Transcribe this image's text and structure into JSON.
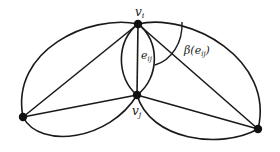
{
  "diagram": {
    "type": "graph",
    "labels": {
      "vi_base": "v",
      "vi_sub": "i",
      "vj_base": "v",
      "vj_sub": "j",
      "eij_base": "e",
      "eij_sub": "ij",
      "beta_prefix": "β(e",
      "beta_sub": "ij",
      "beta_suffix": ")"
    },
    "vertices": [
      {
        "id": "v_i",
        "label": "v_i",
        "x": 138,
        "y": 24
      },
      {
        "id": "v_j",
        "label": "v_j",
        "x": 137,
        "y": 95
      },
      {
        "id": "left",
        "label": "",
        "x": 23,
        "y": 117
      },
      {
        "id": "right",
        "label": "",
        "x": 258,
        "y": 129
      }
    ],
    "edges": [
      {
        "from": "v_i",
        "to": "v_j",
        "kind": "straight",
        "label": "e_ij"
      },
      {
        "from": "v_i",
        "to": "v_j",
        "kind": "curved-left"
      },
      {
        "from": "v_i",
        "to": "v_j",
        "kind": "curved-right"
      },
      {
        "from": "v_i",
        "to": "left",
        "kind": "straight"
      },
      {
        "from": "v_i",
        "to": "left",
        "kind": "curved-outer"
      },
      {
        "from": "v_i",
        "to": "right",
        "kind": "straight"
      },
      {
        "from": "v_i",
        "to": "right",
        "kind": "curved-outer"
      },
      {
        "from": "v_j",
        "to": "left",
        "kind": "straight"
      },
      {
        "from": "v_j",
        "to": "left",
        "kind": "curved-lower"
      },
      {
        "from": "v_j",
        "to": "right",
        "kind": "straight"
      },
      {
        "from": "v_j",
        "to": "right",
        "kind": "curved-lower"
      }
    ],
    "annotations": [
      {
        "type": "angle-arc",
        "label": "β(e_ij)",
        "around": "v_i"
      }
    ],
    "colors": {
      "stroke": "#1a1a1a",
      "background": "#ffffff"
    }
  }
}
